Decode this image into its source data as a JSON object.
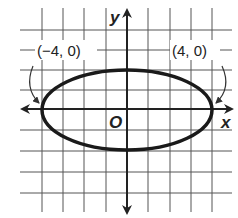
{
  "diagram": {
    "type": "coordinate-plane-ellipse",
    "axes": {
      "x_label": "x",
      "y_label": "y",
      "origin_label": "O"
    },
    "grid": {
      "x_range": [
        -4,
        4
      ],
      "y_range": [
        -4,
        4
      ]
    },
    "ellipse": {
      "center": [
        0,
        0
      ],
      "semi_major_x": 4,
      "semi_minor_y": 2
    },
    "points": [
      {
        "label": "(−4, 0)",
        "x": -4,
        "y": 0
      },
      {
        "label": "(4, 0)",
        "x": 4,
        "y": 0
      }
    ]
  }
}
